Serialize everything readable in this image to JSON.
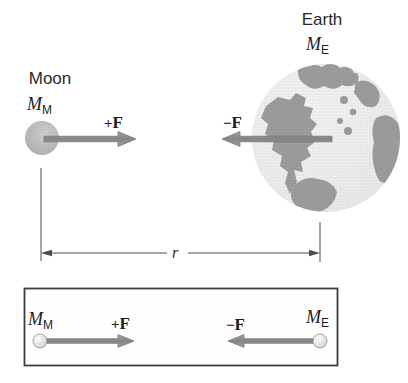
{
  "diagram": {
    "moon": {
      "name": "Moon",
      "mass_base": "M",
      "mass_sub": "M"
    },
    "earth": {
      "name": "Earth",
      "mass_base": "M",
      "mass_sub": "E"
    },
    "force_plus": {
      "sign": "+",
      "symbol": "F"
    },
    "force_minus": {
      "sign": "−",
      "symbol": "F"
    },
    "separation_label": "r"
  },
  "inset": {
    "moon_mass_base": "M",
    "moon_mass_sub": "M",
    "earth_mass_base": "M",
    "earth_mass_sub": "E",
    "force_plus_sign": "+",
    "force_plus_symbol": "F",
    "force_minus_sign": "−",
    "force_minus_symbol": "F"
  },
  "colors": {
    "background": "#ffffff",
    "text": "#2a2a2a",
    "arrow_fill": "#8e8e8e",
    "arrow_outline": "#6e6e6e",
    "earth_ocean": "#e9e9e9",
    "earth_land": "#9c9c9c",
    "moon_fill": "#b5b5b5",
    "dimension_line": "#4d4d4d",
    "box_border": "#3d3d3d"
  }
}
